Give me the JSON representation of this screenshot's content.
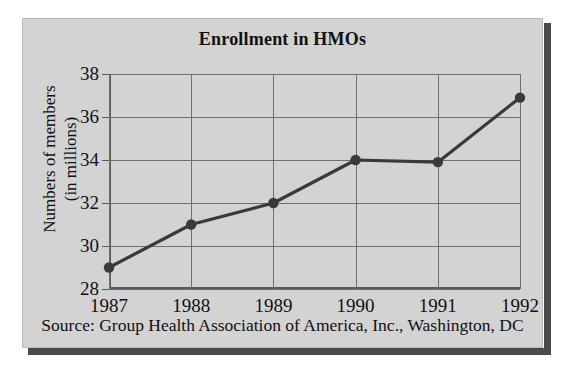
{
  "chart_data": {
    "type": "line",
    "title": "Enrollment in HMOs",
    "xlabel": "",
    "ylabel": "Numbers of members (in millions)",
    "ylabel_line1": "Numbers of members",
    "ylabel_line2": "(in millions)",
    "categories": [
      "1987",
      "1988",
      "1989",
      "1990",
      "1991",
      "1992"
    ],
    "values": [
      29,
      31,
      32,
      34,
      33.9,
      36.9
    ],
    "series": [
      {
        "name": "HMO enrollment",
        "values": [
          29,
          31,
          32,
          34,
          33.9,
          36.9
        ]
      }
    ],
    "ylim": [
      28,
      38
    ],
    "yticks": [
      28,
      30,
      32,
      34,
      36,
      38
    ],
    "ytick_labels": [
      "28",
      "30",
      "32",
      "34",
      "36",
      "38"
    ],
    "xtick_labels": [
      "1987",
      "1988",
      "1989",
      "1990",
      "1991",
      "1992"
    ],
    "grid": true,
    "legend": false,
    "legend_position": "none",
    "marker": "filled-circle",
    "line_color": "#3a3a3a",
    "grid_color": "#6f6f6f",
    "plot_background": "#d3d3d3",
    "source_note": "Source: Group Health Association of America, Inc., Washington, DC"
  },
  "figure": {
    "title": "Enrollment in HMOs",
    "source": "Source: Group Health Association of America, Inc., Washington, DC",
    "panel_color": "#d3d3d3",
    "shadow_color": "#4a4a4a"
  }
}
